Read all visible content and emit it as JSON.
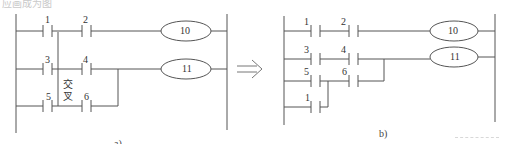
{
  "header": {
    "caption_text": "应画成为图"
  },
  "colors": {
    "line": "#555555",
    "text": "#333333",
    "arrow": "#777777"
  },
  "diagram_a": {
    "label": "a)",
    "cross_label_line1": "交",
    "cross_label_line2": "叉",
    "contacts": [
      {
        "id": "1",
        "label": "1"
      },
      {
        "id": "2",
        "label": "2"
      },
      {
        "id": "3",
        "label": "3"
      },
      {
        "id": "4",
        "label": "4"
      },
      {
        "id": "5",
        "label": "5"
      },
      {
        "id": "6",
        "label": "6"
      }
    ],
    "coils": [
      {
        "id": "10",
        "label": "10"
      },
      {
        "id": "11",
        "label": "11"
      }
    ]
  },
  "arrow": {
    "symbol": "⟹",
    "meaning": "converts-to"
  },
  "diagram_b": {
    "label": "b)",
    "contacts": [
      {
        "id": "1",
        "label": "1"
      },
      {
        "id": "2",
        "label": "2"
      },
      {
        "id": "3",
        "label": "3"
      },
      {
        "id": "4",
        "label": "4"
      },
      {
        "id": "5",
        "label": "5"
      },
      {
        "id": "6",
        "label": "6"
      },
      {
        "id": "1b",
        "label": "1"
      }
    ],
    "coils": [
      {
        "id": "10",
        "label": "10"
      },
      {
        "id": "11",
        "label": "11"
      }
    ]
  }
}
